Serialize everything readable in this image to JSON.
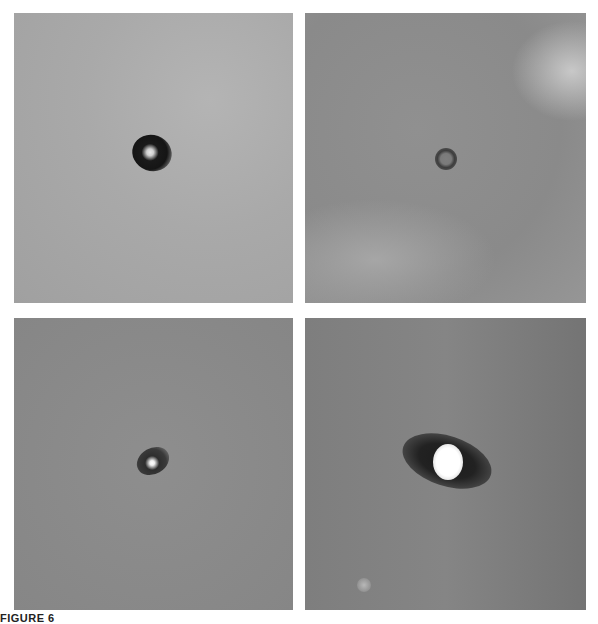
{
  "figure": {
    "caption": "FIGURE 6",
    "panels": [
      {
        "id": "top-left",
        "description": "dark elliptical ring with bright core on light gray background"
      },
      {
        "id": "top-right",
        "description": "small faint dark ring on mottled gray background"
      },
      {
        "id": "bottom-left",
        "description": "small dark halo with bright point on gray background"
      },
      {
        "id": "bottom-right",
        "description": "bright oval core with dark elongated halo on streaked gray background, faint spot lower left"
      }
    ]
  }
}
